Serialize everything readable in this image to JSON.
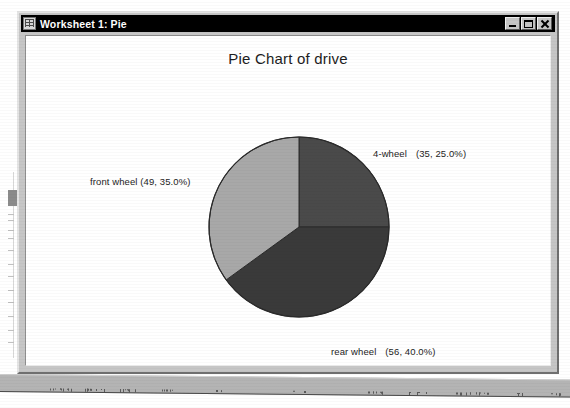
{
  "window": {
    "title": "Worksheet 1: Pie",
    "icon": "worksheet-grid-icon",
    "buttons": {
      "minimize": "minimize-button",
      "maximize": "maximize-button",
      "close": "close-button"
    }
  },
  "chart_data": {
    "type": "pie",
    "title": "Pie Chart of drive",
    "xlabel": "",
    "ylabel": "",
    "total": 140,
    "start_angle_deg": 0,
    "direction": "clockwise",
    "categories": [
      "4-wheel",
      "rear wheel",
      "front wheel"
    ],
    "values": [
      35,
      56,
      49
    ],
    "percents": [
      25.0,
      40.0,
      35.0
    ],
    "colors": [
      "#4a4a4a",
      "#3a3a3a",
      "#a8a8a8"
    ],
    "slices": [
      {
        "name": "4-wheel",
        "value": 35,
        "percent": 25.0,
        "color": "#4a4a4a",
        "label": "4-wheel",
        "detail": "(35, 25.0%)"
      },
      {
        "name": "rear wheel",
        "value": 56,
        "percent": 40.0,
        "color": "#3a3a3a",
        "label": "rear wheel",
        "detail": "(56, 40.0%)"
      },
      {
        "name": "front wheel",
        "value": 49,
        "percent": 35.0,
        "color": "#a8a8a8",
        "label": "front wheel",
        "detail": "(49, 35.0%)"
      }
    ],
    "legend": "none",
    "grid": false
  }
}
